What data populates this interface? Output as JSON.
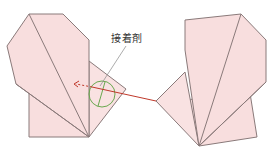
{
  "diagram": {
    "label": "接着剤",
    "colors": {
      "paper_fill": "#f8dede",
      "paper_fill_light": "#fbe6e6",
      "outline": "#8a7a7a",
      "arrow": "#c0392b",
      "glue_circle": "#6aa84f",
      "leader_line": "#888888"
    },
    "parts": [
      {
        "id": "left-folded-piece",
        "description": "left origami heart-shaped half"
      },
      {
        "id": "right-folded-piece",
        "description": "right origami heart-shaped half"
      },
      {
        "id": "glue-area",
        "description": "circled glue location on left tab"
      },
      {
        "id": "insert-arrow",
        "description": "dashed red arrow showing right tab inserted into left piece"
      }
    ]
  }
}
